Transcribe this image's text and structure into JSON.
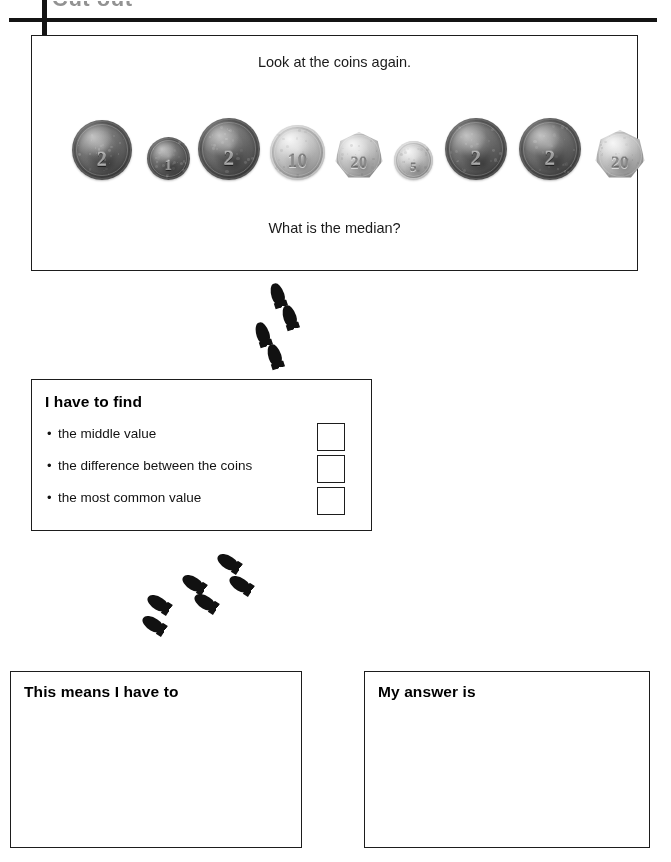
{
  "page": {
    "header_partial_text": "Cut out",
    "background_color": "#ffffff",
    "ink_color": "#1d1d1d"
  },
  "question_panel": {
    "prompt_top": "Look at the coins again.",
    "prompt_bottom": "What is the median?",
    "coins": [
      {
        "name": "coin-2p",
        "label": "2",
        "denomination": "2p",
        "metal": "copper",
        "shape": "round",
        "diameter_px": 60,
        "left_px": 40
      },
      {
        "name": "coin-1p",
        "label": "1",
        "denomination": "1p",
        "metal": "copper",
        "shape": "round",
        "diameter_px": 43,
        "left_px": 115
      },
      {
        "name": "coin-2p",
        "label": "2",
        "denomination": "2p",
        "metal": "copper",
        "shape": "round",
        "diameter_px": 62,
        "left_px": 166
      },
      {
        "name": "coin-10p",
        "label": "10",
        "denomination": "10p",
        "metal": "silver",
        "shape": "round",
        "diameter_px": 55,
        "left_px": 238
      },
      {
        "name": "coin-20p",
        "label": "20",
        "denomination": "20p",
        "metal": "silver",
        "shape": "heptagon",
        "diameter_px": 48,
        "left_px": 303
      },
      {
        "name": "coin-5p",
        "label": "5",
        "denomination": "5p",
        "metal": "silver",
        "shape": "round",
        "diameter_px": 39,
        "left_px": 362
      },
      {
        "name": "coin-2p",
        "label": "2",
        "denomination": "2p",
        "metal": "copper",
        "shape": "round",
        "diameter_px": 62,
        "left_px": 413
      },
      {
        "name": "coin-2p",
        "label": "2",
        "denomination": "2p",
        "metal": "copper",
        "shape": "round",
        "diameter_px": 62,
        "left_px": 487
      },
      {
        "name": "coin-20p",
        "label": "20",
        "denomination": "20p",
        "metal": "silver",
        "shape": "heptagon",
        "diameter_px": 50,
        "left_px": 563
      }
    ]
  },
  "footprint_trails": [
    {
      "name": "footprint-trail-upper",
      "prints": [
        {
          "left": 271,
          "top": 283,
          "rotate": -18
        },
        {
          "left": 283,
          "top": 305,
          "rotate": -18
        },
        {
          "left": 256,
          "top": 322,
          "rotate": -18
        },
        {
          "left": 268,
          "top": 344,
          "rotate": -18
        }
      ]
    },
    {
      "name": "footprint-trail-lower",
      "prints": [
        {
          "left": 221,
          "top": 551,
          "rotate": -58
        },
        {
          "left": 233,
          "top": 573,
          "rotate": -58
        },
        {
          "left": 186,
          "top": 572,
          "rotate": -58
        },
        {
          "left": 198,
          "top": 591,
          "rotate": -58
        },
        {
          "left": 151,
          "top": 592,
          "rotate": -58
        },
        {
          "left": 146,
          "top": 613,
          "rotate": -58
        }
      ]
    }
  ],
  "find_panel": {
    "title": "I have to find",
    "bullet_glyph": "•",
    "options": [
      {
        "label": "the middle value"
      },
      {
        "label": "the difference between the coins"
      },
      {
        "label": "the most common value"
      }
    ]
  },
  "means_panel": {
    "heading": "This means I have to",
    "value": ""
  },
  "answer_panel": {
    "heading": "My answer is",
    "value": ""
  }
}
